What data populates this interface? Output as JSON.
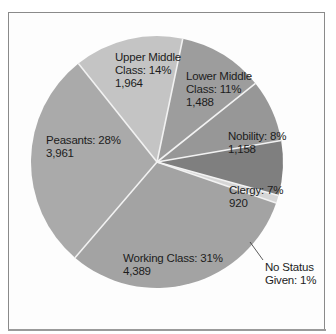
{
  "chart_data": {
    "type": "pie",
    "title": "",
    "start_angle_deg": -38.6,
    "center": [
      157,
      162
    ],
    "radius": 126,
    "slices": [
      {
        "name": "Upper Middle Class",
        "label_line1": "Upper Middle",
        "label_line2": "Class: 14%",
        "value_text": "1,964",
        "percent": 14,
        "value": 1964,
        "color": "#c4c4c4"
      },
      {
        "name": "Lower Middle Class",
        "label_line1": "Lower Middle",
        "label_line2": "Class: 11%",
        "value_text": "1,488",
        "percent": 11,
        "value": 1488,
        "color": "#9d9d9d"
      },
      {
        "name": "Nobility",
        "label_line1": "Nobility: 8%",
        "label_line2": "1,158",
        "value_text": "",
        "percent": 8,
        "value": 1158,
        "color": "#979797"
      },
      {
        "name": "Clergy",
        "label_line1": "Clergy: 7%",
        "label_line2": "920",
        "value_text": "",
        "percent": 7,
        "value": 920,
        "color": "#7f7f7f"
      },
      {
        "name": "No Status Given",
        "label_line1": "No Status",
        "label_line2": "Given: 1%",
        "value_text": "",
        "percent": 1,
        "value": null,
        "color": "#d6d6d6"
      },
      {
        "name": "Working Class",
        "label_line1": "Working Class: 31%",
        "label_line2": "4,389",
        "value_text": "",
        "percent": 31,
        "value": 4389,
        "color": "#a3a3a3"
      },
      {
        "name": "Peasants",
        "label_line1": "Peasants: 28%",
        "label_line2": "3,961",
        "value_text": "",
        "percent": 28,
        "value": 3961,
        "color": "#aaaaaa"
      }
    ],
    "divider_color": "#f2f2f2",
    "legend": "none",
    "grid": false
  }
}
